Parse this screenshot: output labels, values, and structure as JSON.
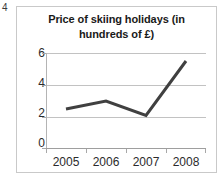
{
  "question_number": "4",
  "chart_data": {
    "type": "line",
    "title": "Price of skiing holidays (in hundreds of £)",
    "title_lines": [
      "Price of skiing holidays (in",
      "hundreds of £)"
    ],
    "categories": [
      "2005",
      "2006",
      "2007",
      "2008"
    ],
    "values": [
      2.5,
      3.0,
      2.1,
      5.5
    ],
    "series": [
      {
        "name": "Price",
        "values": [
          2.5,
          3.0,
          2.1,
          5.5
        ],
        "color": "#404040"
      }
    ],
    "xlabel": "",
    "ylabel": "",
    "ylim": [
      0,
      6
    ],
    "yticks": [
      "0",
      "2",
      "4",
      "6"
    ],
    "ytick_values": [
      0,
      2,
      4,
      6
    ],
    "grid": true,
    "legend": false,
    "markers": false,
    "line_width": 3,
    "colors": {
      "line": "#404040",
      "gridline": "#c2c2c2",
      "axis": "#9e9e9e",
      "frame": "#c9c9c9",
      "text": "#2b2b2b",
      "title_text": "#1a1a1a",
      "background": "#ffffff"
    }
  }
}
